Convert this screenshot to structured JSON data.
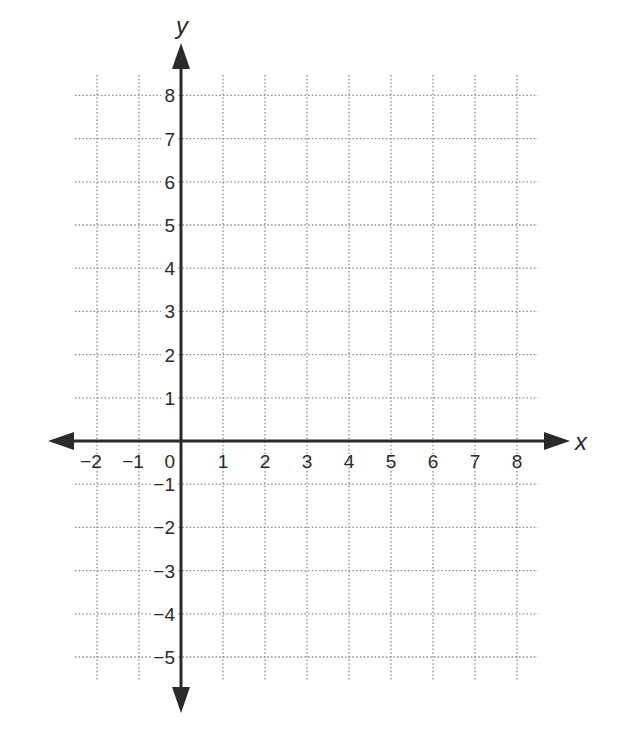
{
  "chart_data": {
    "type": "coordinate-grid",
    "title": "",
    "xlabel": "x",
    "ylabel": "y",
    "xlim": [
      -2,
      8
    ],
    "ylim": [
      -5,
      8
    ],
    "grid": true,
    "grid_style": "dotted",
    "x_ticks": [
      "−2",
      "−1",
      "0",
      "1",
      "2",
      "3",
      "4",
      "5",
      "6",
      "7",
      "8"
    ],
    "y_ticks": [
      "8",
      "7",
      "6",
      "5",
      "4",
      "3",
      "2",
      "1",
      "−1",
      "−2",
      "−3",
      "−4",
      "−5"
    ],
    "series": []
  },
  "colors": {
    "axis": "#2a2a2a",
    "grid": "#8a8a8a",
    "background": "#ffffff"
  },
  "axes": {
    "x_label": "x",
    "y_label": "y"
  }
}
